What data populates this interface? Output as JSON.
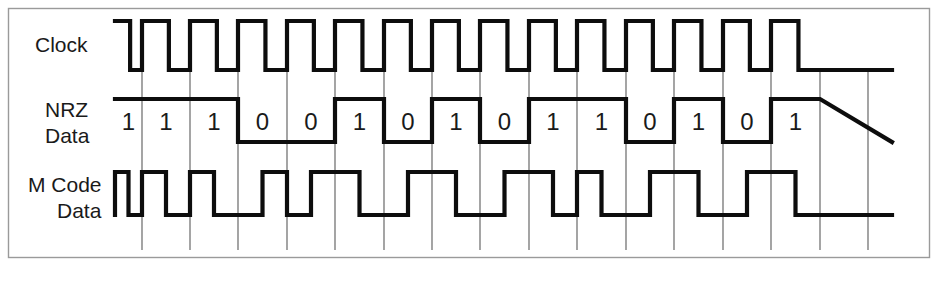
{
  "figure": {
    "background_color": "#ffffff",
    "frame_color": "#9a9a9a",
    "wave_color": "#0d0d0d",
    "grid_color": "#5a5a5a",
    "text_color": "#1a1a1a"
  },
  "labels": {
    "clock": "Clock",
    "nrz_line1": "NRZ",
    "nrz_line2": "Data",
    "mcode_line1": "M Code",
    "mcode_line2": "Data"
  },
  "chart_data": {
    "type": "line",
    "xlabel": "",
    "ylabel": "",
    "grid": true,
    "legend_position": "left",
    "bit_count": 15,
    "bit_period_px": 48.4,
    "categories": [
      "1",
      "2",
      "3",
      "4",
      "5",
      "6",
      "7",
      "8",
      "9",
      "10",
      "11",
      "12",
      "13",
      "14",
      "15"
    ],
    "bits": [
      "1",
      "1",
      "1",
      "0",
      "0",
      "1",
      "0",
      "1",
      "0",
      "1",
      "1",
      "0",
      "1",
      "0",
      "1"
    ],
    "series": [
      {
        "name": "Clock",
        "type": "square-wave",
        "description": "Free-running clock, high for first half of each bit period, low for second half",
        "levels": [
          "H",
          "L",
          "H",
          "L",
          "H",
          "L",
          "H",
          "L",
          "H",
          "L",
          "H",
          "L",
          "H",
          "L",
          "H",
          "L",
          "H",
          "L",
          "H",
          "L",
          "H",
          "L",
          "H",
          "L",
          "H",
          "L",
          "H",
          "L",
          "H",
          "L"
        ],
        "high_y": 21,
        "low_y": 70
      },
      {
        "name": "NRZ Data",
        "type": "square-wave",
        "description": "Non-return-to-zero data; level held high for 1 and low for 0 across the whole bit period",
        "values": [
          1,
          1,
          1,
          0,
          0,
          1,
          0,
          1,
          0,
          1,
          1,
          0,
          1,
          0,
          1
        ],
        "high_y": 99,
        "low_y": 142
      },
      {
        "name": "M Code Data",
        "type": "square-wave",
        "description": "Manchester encoded data; mid-bit transition carries the bit value",
        "values": [
          1,
          1,
          1,
          0,
          0,
          1,
          0,
          1,
          0,
          1,
          1,
          0,
          1,
          0,
          1
        ],
        "high_y": 172,
        "low_y": 215
      }
    ],
    "grid_x_positions": [
      142,
      190,
      238,
      287,
      335,
      384,
      432,
      480,
      529,
      577,
      626,
      674,
      723,
      771,
      820,
      868
    ],
    "x_start": 115,
    "x_end": 892
  }
}
